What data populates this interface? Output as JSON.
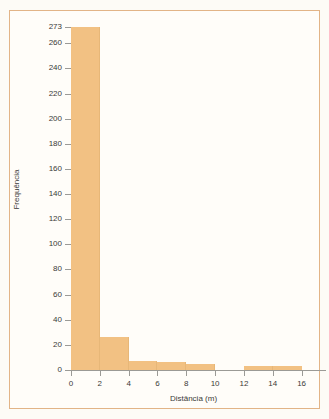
{
  "figure": {
    "background_color": "#fffdf9",
    "frame_color": "#e2b487",
    "bar_color": "#f2c183",
    "axis_color": "#9b9a96",
    "text_color": "#3b3a38"
  },
  "chart_data": {
    "type": "bar",
    "title": "",
    "subtitle": "",
    "xlabel": "Distância (m)",
    "ylabel": "Frequência",
    "grid": false,
    "legend": null,
    "xlim": [
      0,
      17
    ],
    "ylim": [
      0,
      273
    ],
    "xticks": [
      0,
      2,
      4,
      6,
      8,
      10,
      12,
      14,
      16
    ],
    "xtick_labels": [
      "0",
      "2",
      "4",
      "6",
      "8",
      "10",
      "12",
      "14",
      "16"
    ],
    "yticks": [
      0,
      20,
      40,
      60,
      80,
      100,
      120,
      140,
      160,
      180,
      200,
      220,
      240,
      260,
      273
    ],
    "ytick_labels": [
      "0",
      "20",
      "40",
      "60",
      "80",
      "100",
      "120",
      "140",
      "160",
      "180",
      "200",
      "220",
      "240",
      "260",
      "273"
    ],
    "bin_width": 2,
    "bins": [
      {
        "label": "0-2",
        "x0": 0,
        "x1": 2,
        "value": 273
      },
      {
        "label": "2-4",
        "x0": 2,
        "x1": 4,
        "value": 26
      },
      {
        "label": "4-6",
        "x0": 4,
        "x1": 6,
        "value": 7
      },
      {
        "label": "6-8",
        "x0": 6,
        "x1": 8,
        "value": 6
      },
      {
        "label": "8-10",
        "x0": 8,
        "x1": 10,
        "value": 5
      },
      {
        "label": "10-12",
        "x0": 10,
        "x1": 12,
        "value": 0
      },
      {
        "label": "12-14",
        "x0": 12,
        "x1": 14,
        "value": 3
      },
      {
        "label": "14-16",
        "x0": 14,
        "x1": 16,
        "value": 3
      }
    ],
    "categories": [
      "0-2",
      "2-4",
      "4-6",
      "6-8",
      "8-10",
      "10-12",
      "12-14",
      "14-16"
    ],
    "values": [
      273,
      26,
      7,
      6,
      5,
      0,
      3,
      3
    ]
  }
}
